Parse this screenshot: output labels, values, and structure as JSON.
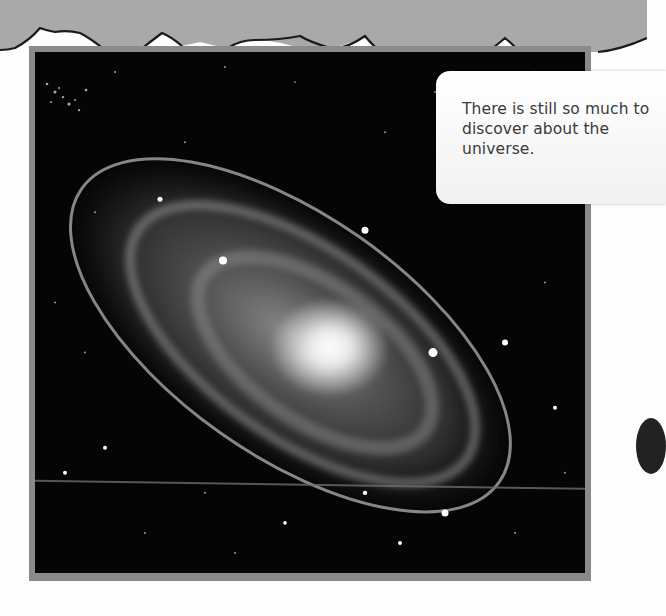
{
  "page": {
    "background": "#fdfdfd",
    "top_band_color": "#a9a9a9",
    "frame_color": "#8a8a8a"
  },
  "photo": {
    "subject": "spiral-galaxy",
    "style": "greyscale"
  },
  "callout": {
    "text": "There is still so much to discover about the universe."
  }
}
